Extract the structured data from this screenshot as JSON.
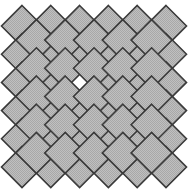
{
  "figure": {
    "width": 188,
    "height": 191,
    "background_color": "#ffffff"
  },
  "pattern": {
    "kind": "diamond-lattice",
    "tile_shape": "diamond",
    "tile_fill_color": "#b4b4b4",
    "tile_fill_texture": "dithered-checker",
    "tile_texture_color_light": "#c8c8c8",
    "tile_texture_color_dark": "#a0a0a0",
    "tile_stroke_color": "#3a3a3a",
    "tile_stroke_width": 1.6,
    "missing_tile_fill_color": "#ffffff",
    "half_diagonal_x": 20.5,
    "half_diagonal_y": 20.5,
    "pitch_x": 28.8,
    "pitch_y": 28.2,
    "origin_x": 22.0,
    "origin_y": 26.0,
    "columns": 6,
    "rows": 6,
    "offset_columns": 5,
    "offset_rows": 5,
    "top_peak_count": 6,
    "bottom_peak_count": 6,
    "left_peak_count": 6,
    "right_peak_count": 6,
    "bounds": {
      "left": 8,
      "top": 12,
      "right": 180,
      "bottom": 180
    },
    "missing_tile": {
      "row": 2,
      "col": 2,
      "center_x": 94.0,
      "center_y": 96.0
    },
    "overlap_mode": "tiles-overlap-corners"
  },
  "chart_data": {
    "type": "heatmap",
    "xlabel": "",
    "ylabel": "",
    "grid": false,
    "legend": "none",
    "categories": [
      "col0",
      "col1",
      "col2",
      "col3",
      "col4",
      "col5"
    ],
    "row_labels": [
      "row0",
      "row1",
      "row2",
      "row3",
      "row4",
      "row5"
    ],
    "values": [
      [
        1,
        1,
        1,
        1,
        1,
        1
      ],
      [
        1,
        1,
        1,
        1,
        1,
        1
      ],
      [
        1,
        1,
        0,
        1,
        1,
        1
      ],
      [
        1,
        1,
        1,
        1,
        1,
        1
      ],
      [
        1,
        1,
        1,
        1,
        1,
        1
      ],
      [
        1,
        1,
        1,
        1,
        1,
        1
      ]
    ],
    "offset_values": [
      [
        1,
        1,
        1,
        1,
        1
      ],
      [
        1,
        1,
        1,
        1,
        1
      ],
      [
        1,
        1,
        1,
        1,
        1
      ],
      [
        1,
        1,
        1,
        1,
        1
      ],
      [
        1,
        1,
        1,
        1,
        1
      ]
    ],
    "value_meaning": {
      "1": "filled gray diamond tile",
      "0": "empty white gap"
    },
    "total_tiles": 61,
    "filled_tiles": 60,
    "empty_tiles": 1
  }
}
